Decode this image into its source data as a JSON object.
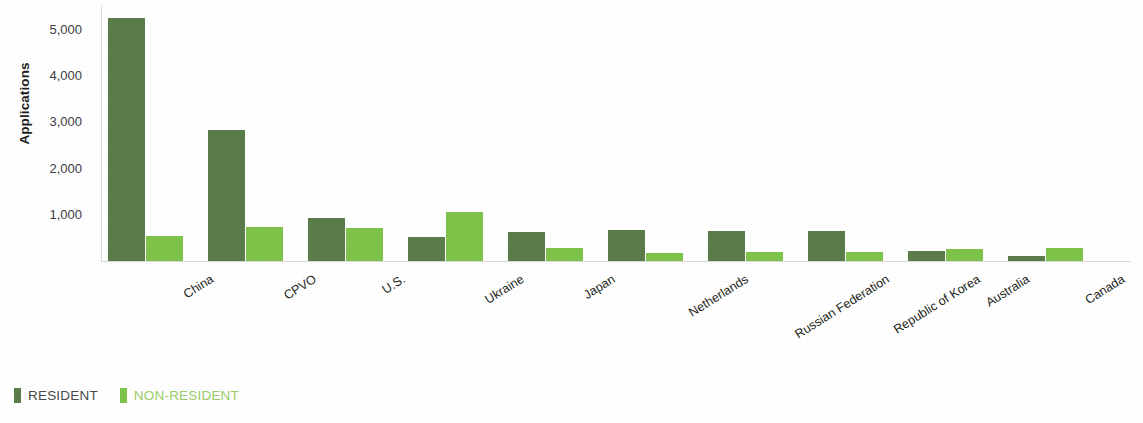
{
  "chart_data": {
    "type": "bar",
    "title": "",
    "xlabel": "",
    "ylabel": "Applications",
    "ylim": [
      0,
      5600
    ],
    "yticks": [
      1000,
      2000,
      3000,
      4000,
      5000
    ],
    "ytick_labels": [
      "1,000",
      "2,000",
      "3,000",
      "4,000",
      "5,000"
    ],
    "grid": false,
    "legend_position": "bottom-left",
    "categories": [
      "China",
      "CPVO",
      "U.S.",
      "Ukraine",
      "Japan",
      "Netherlands",
      "Russian Federation",
      "Republic of Korea",
      "Australia",
      "Canada"
    ],
    "series": [
      {
        "name": "RESIDENT",
        "color": "#5a7d4a",
        "values": [
          5244,
          2830,
          930,
          520,
          625,
          670,
          650,
          645,
          215,
          105
        ]
      },
      {
        "name": "NON-RESIDENT",
        "color": "#7ec34a",
        "values": [
          540,
          735,
          715,
          1060,
          285,
          175,
          195,
          200,
          260,
          285
        ]
      }
    ]
  },
  "legend": {
    "items": [
      {
        "label": "RESIDENT",
        "color": "#5a7d4a"
      },
      {
        "label": "NON-RESIDENT",
        "color": "#7ec34a"
      }
    ]
  },
  "axis": {
    "y_title": "Applications"
  }
}
